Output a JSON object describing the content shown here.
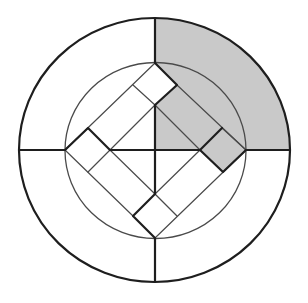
{
  "diagram": {
    "title": "",
    "background": "#ffffff",
    "stroke_color": "#1e1e1e",
    "thin_stroke_color": "#4a4a4a",
    "shade_color": "#c9c9c9",
    "outer_circle": {
      "cx": 154.5,
      "cy": 150,
      "rx": 135.5,
      "ry": 132
    },
    "inner_circle": {
      "cx": 155.5,
      "cy": 150.5,
      "rx": 90.5,
      "ry": 88
    },
    "diamond_vertices": {
      "top": [
        155,
        63
      ],
      "right": [
        246,
        150
      ],
      "bottom": [
        155,
        238
      ],
      "left": [
        65,
        150
      ]
    },
    "shaded_regions": [
      "outer-ring-top-right-quadrant",
      "inner-top-right-region"
    ]
  }
}
